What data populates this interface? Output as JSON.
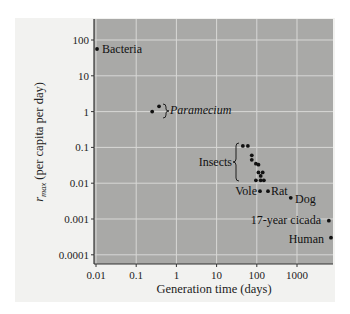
{
  "chart_data": {
    "type": "scatter",
    "title": "",
    "xlabel": "Generation time (days)",
    "ylabel_main": "r",
    "ylabel_sub": "max",
    "ylabel_rest": " (per capita per day)",
    "xscale": "log",
    "yscale": "log",
    "xlim": [
      0.01,
      8000
    ],
    "ylim": [
      8e-05,
      200
    ],
    "grid": true,
    "x_ticks": [
      {
        "value": 0.01,
        "label": "0.01"
      },
      {
        "value": 0.1,
        "label": "0.1"
      },
      {
        "value": 1,
        "label": "1"
      },
      {
        "value": 10,
        "label": "10"
      },
      {
        "value": 100,
        "label": "100"
      },
      {
        "value": 1000,
        "label": "1000"
      }
    ],
    "y_ticks": [
      {
        "value": 100,
        "label": "100"
      },
      {
        "value": 10,
        "label": "10"
      },
      {
        "value": 1,
        "label": "1"
      },
      {
        "value": 0.1,
        "label": "0.1"
      },
      {
        "value": 0.01,
        "label": "0.01"
      },
      {
        "value": 0.001,
        "label": "0.001"
      },
      {
        "value": 0.0001,
        "label": "0.0001"
      }
    ],
    "series": [
      {
        "name": "Bacteria",
        "points": [
          {
            "x": 0.0106,
            "y": 56
          }
        ]
      },
      {
        "name": "Paramecium",
        "points": [
          {
            "x": 0.25,
            "y": 1.0
          },
          {
            "x": 0.37,
            "y": 1.4
          }
        ]
      },
      {
        "name": "Insects",
        "points": [
          {
            "x": 45,
            "y": 0.11
          },
          {
            "x": 60,
            "y": 0.11
          },
          {
            "x": 75,
            "y": 0.06
          },
          {
            "x": 75,
            "y": 0.045
          },
          {
            "x": 95,
            "y": 0.035
          },
          {
            "x": 110,
            "y": 0.033
          },
          {
            "x": 110,
            "y": 0.02
          },
          {
            "x": 140,
            "y": 0.02
          },
          {
            "x": 125,
            "y": 0.016
          },
          {
            "x": 95,
            "y": 0.012
          },
          {
            "x": 125,
            "y": 0.012
          },
          {
            "x": 150,
            "y": 0.012
          }
        ]
      },
      {
        "name": "Vole",
        "points": [
          {
            "x": 120,
            "y": 0.006
          }
        ]
      },
      {
        "name": "Rat",
        "points": [
          {
            "x": 190,
            "y": 0.006
          }
        ]
      },
      {
        "name": "Dog",
        "points": [
          {
            "x": 700,
            "y": 0.0039
          }
        ]
      },
      {
        "name": "17-year cicada",
        "points": [
          {
            "x": 6200,
            "y": 0.0009
          }
        ]
      },
      {
        "name": "Human",
        "points": [
          {
            "x": 7000,
            "y": 0.0003
          }
        ]
      }
    ],
    "annotations": [
      {
        "text": "Bacteria",
        "style": "normal"
      },
      {
        "text": "Paramecium",
        "style": "italic",
        "bracket": true
      },
      {
        "text": "Insects",
        "style": "normal",
        "bracket": true
      },
      {
        "text": "Vole",
        "style": "normal"
      },
      {
        "text": "Rat",
        "style": "normal"
      },
      {
        "text": "Dog",
        "style": "normal"
      },
      {
        "text": "17-year cicada",
        "style": "normal"
      },
      {
        "text": "Human",
        "style": "normal"
      }
    ]
  },
  "colors": {
    "plot_background": "#a9a9a7",
    "outer_background": "#f2f2f0",
    "gridline": "#d8d8d6",
    "point": "#111111",
    "axis": "#333333"
  }
}
